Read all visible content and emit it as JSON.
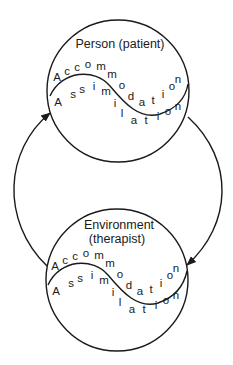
{
  "diagram": {
    "type": "interaction-cycle",
    "colors": {
      "line": "#1a1a1a",
      "background": "#ffffff"
    },
    "nodes": [
      {
        "id": "person",
        "title_lines": [
          "Person (patient)"
        ],
        "upper_word": "Accommodation",
        "lower_word": "Assimilation",
        "center": [
          118,
          91
        ],
        "radius": 71
      },
      {
        "id": "environment",
        "title_lines": [
          "Environment",
          "(therapist)"
        ],
        "upper_word": "Accommodation",
        "lower_word": "Assimilation",
        "center": [
          117,
          280
        ],
        "radius": 71
      }
    ],
    "arrows": [
      {
        "id": "left-arrow",
        "from": "environment",
        "to": "person",
        "side": "left"
      },
      {
        "id": "right-arrow",
        "from": "person",
        "to": "environment",
        "side": "right"
      }
    ],
    "letters": {
      "accommodation": [
        {
          "ch": "A",
          "x": 0,
          "y": 0
        },
        {
          "ch": "c",
          "x": 10,
          "y": -6
        },
        {
          "ch": "c",
          "x": 20,
          "y": -10
        },
        {
          "ch": "o",
          "x": 31,
          "y": -13
        },
        {
          "ch": "m",
          "x": 44,
          "y": -11
        },
        {
          "ch": "m",
          "x": 55,
          "y": -3
        },
        {
          "ch": "o",
          "x": 65,
          "y": 8
        },
        {
          "ch": "d",
          "x": 74,
          "y": 19
        },
        {
          "ch": "a",
          "x": 85,
          "y": 25
        },
        {
          "ch": "t",
          "x": 96,
          "y": 23
        },
        {
          "ch": "i",
          "x": 106,
          "y": 17
        },
        {
          "ch": "o",
          "x": 115,
          "y": 9
        },
        {
          "ch": "n",
          "x": 121,
          "y": 2
        }
      ],
      "assimilation": [
        {
          "ch": "A",
          "x": 1,
          "y": 25
        },
        {
          "ch": "s",
          "x": 16,
          "y": 17
        },
        {
          "ch": "s",
          "x": 25,
          "y": 12
        },
        {
          "ch": "i",
          "x": 37,
          "y": 9
        },
        {
          "ch": "m",
          "x": 49,
          "y": 14
        },
        {
          "ch": "i",
          "x": 58,
          "y": 26
        },
        {
          "ch": "l",
          "x": 65,
          "y": 36
        },
        {
          "ch": "a",
          "x": 77,
          "y": 43
        },
        {
          "ch": "t",
          "x": 89,
          "y": 43
        },
        {
          "ch": "i",
          "x": 101,
          "y": 39
        },
        {
          "ch": "o",
          "x": 111,
          "y": 34
        },
        {
          "ch": "n",
          "x": 121,
          "y": 29
        }
      ]
    }
  },
  "labels": {
    "person_title": "Person (patient)",
    "environment_title_1": "Environment",
    "environment_title_2": "(therapist)"
  }
}
